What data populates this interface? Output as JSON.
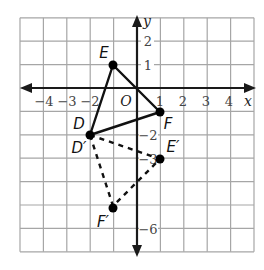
{
  "diagram": {
    "type": "coordinate-plane-transformation",
    "grid": {
      "x_min": -5,
      "x_max": 5,
      "y_min": -7,
      "y_max": 3,
      "origin_px": [
        137,
        88
      ],
      "cell_px": 23.4
    },
    "axes": {
      "x_label": "x",
      "y_label": "y",
      "origin_label": "O",
      "x_ticks": [
        {
          "value": -4,
          "label": "−4"
        },
        {
          "value": -3,
          "label": "−3"
        },
        {
          "value": -2,
          "label": "−2"
        },
        {
          "value": 1,
          "label": "1"
        },
        {
          "value": 2,
          "label": "2"
        },
        {
          "value": 3,
          "label": "3"
        },
        {
          "value": 4,
          "label": "4"
        }
      ],
      "y_ticks": [
        {
          "value": 2,
          "label": "2"
        },
        {
          "value": 1,
          "label": "1"
        },
        {
          "value": -2,
          "label": "−2"
        },
        {
          "value": -3,
          "label": "−3"
        },
        {
          "value": -6,
          "label": "−6"
        }
      ]
    },
    "original_triangle": {
      "style": "solid",
      "vertices": [
        {
          "name": "D",
          "x": -2,
          "y": -2
        },
        {
          "name": "E",
          "x": -1,
          "y": 1
        },
        {
          "name": "F",
          "x": 1,
          "y": -1
        }
      ]
    },
    "image_triangle": {
      "style": "dashed",
      "vertices": [
        {
          "name": "D′",
          "x": -2,
          "y": -2
        },
        {
          "name": "E′",
          "x": 1,
          "y": -3
        },
        {
          "name": "F′",
          "x": -1,
          "y": -5
        }
      ]
    },
    "labels": {
      "D": "D",
      "E": "E",
      "F": "F",
      "D_prime": "D′",
      "E_prime": "E′",
      "F_prime": "F′"
    },
    "colors": {
      "grid": "#a6a6a6",
      "axis": "#1a1a1a",
      "shape": "#111111"
    }
  }
}
